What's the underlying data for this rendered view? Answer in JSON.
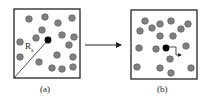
{
  "panels": [
    {
      "id": "a",
      "label": "(a)",
      "box": {
        "x": 14,
        "y": 9,
        "w": 66,
        "h": 69
      },
      "particles": [
        [
          29,
          19
        ],
        [
          45,
          17
        ],
        [
          58,
          23
        ],
        [
          72,
          18
        ],
        [
          42,
          30
        ],
        [
          36,
          38
        ],
        [
          62,
          35
        ],
        [
          74,
          37
        ],
        [
          20,
          42
        ],
        [
          69,
          45
        ],
        [
          20,
          57
        ],
        [
          39,
          62
        ],
        [
          57,
          55
        ],
        [
          73,
          57
        ],
        [
          52,
          68
        ],
        [
          62,
          69
        ],
        [
          73,
          67
        ]
      ],
      "tracer": [
        48,
        40
      ],
      "radius_label": "R",
      "radius_subscript": "s"
    },
    {
      "id": "b",
      "label": "(b)",
      "box": {
        "x": 131,
        "y": 10,
        "w": 66,
        "h": 69
      },
      "particles": [
        [
          145,
          21
        ],
        [
          160,
          24
        ],
        [
          171,
          21
        ],
        [
          140,
          31
        ],
        [
          152,
          28
        ],
        [
          160,
          36
        ],
        [
          173,
          36
        ],
        [
          181,
          29
        ],
        [
          188,
          24
        ],
        [
          139,
          48
        ],
        [
          156,
          49
        ],
        [
          186,
          46
        ],
        [
          170,
          59
        ],
        [
          137,
          67
        ],
        [
          160,
          68
        ],
        [
          171,
          73
        ],
        [
          191,
          68
        ]
      ],
      "tracer": [
        166,
        48
      ]
    }
  ],
  "colors": {
    "particle": "#808080",
    "particle_stroke": "#555555",
    "tracer": "#000000",
    "frame": "#222222"
  }
}
